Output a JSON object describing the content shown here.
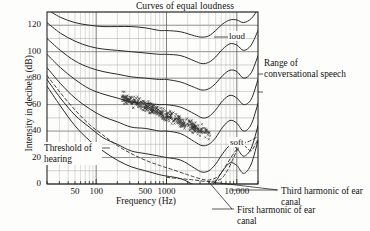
{
  "chart_data": {
    "type": "line",
    "title": "Curves of equal loudness",
    "xlabel": "Frequency (Hz)",
    "ylabel": "Intensity in decibels (dB)",
    "xscale": "log",
    "xlim": [
      20,
      20000
    ],
    "ylim": [
      0,
      130
    ],
    "grid": true,
    "legend_position": "none",
    "yticks": [
      "0",
      "20",
      "40",
      "60",
      "80",
      "100",
      "120"
    ],
    "ytick_values": [
      0,
      20,
      40,
      60,
      80,
      100,
      120
    ],
    "xticks": [
      "50",
      "100",
      "500",
      "1000",
      "10,000"
    ],
    "xtick_values": [
      50,
      100,
      500,
      1000,
      10000
    ],
    "annotations": [
      {
        "name": "loud",
        "text": "loud",
        "x": 6000,
        "y": 105
      },
      {
        "name": "soft",
        "text": "soft",
        "x": 6000,
        "y": 31
      },
      {
        "name": "threshold-of-hearing",
        "text": "Threshold of hearing",
        "x": 40,
        "y": 20
      },
      {
        "name": "range-of-conversational-speech",
        "text": "Range of conversational speech"
      },
      {
        "name": "third-harmonic-of-ear-canal",
        "text": "Third harmonic of ear canal"
      },
      {
        "name": "first-harmonic-of-ear-canal",
        "text": "First harmonic of ear canal"
      }
    ],
    "series": [
      {
        "name": "equal-loudness-120-phon",
        "style": "solid",
        "points": [
          [
            20,
            132
          ],
          [
            31,
            126
          ],
          [
            50,
            122
          ],
          [
            80,
            120
          ],
          [
            125,
            119
          ],
          [
            200,
            119
          ],
          [
            315,
            119
          ],
          [
            500,
            118
          ],
          [
            800,
            116
          ],
          [
            1000,
            116
          ],
          [
            1600,
            115
          ],
          [
            2500,
            112
          ],
          [
            3200,
            111
          ],
          [
            4000,
            112
          ],
          [
            5000,
            116
          ],
          [
            6300,
            121
          ],
          [
            8000,
            124
          ],
          [
            10000,
            124
          ],
          [
            12500,
            122
          ],
          [
            16000,
            125
          ],
          [
            20000,
            132
          ]
        ]
      },
      {
        "name": "equal-loudness-100-phon",
        "style": "solid",
        "points": [
          [
            20,
            122
          ],
          [
            31,
            114
          ],
          [
            50,
            108
          ],
          [
            80,
            104
          ],
          [
            125,
            102
          ],
          [
            200,
            101
          ],
          [
            315,
            100
          ],
          [
            500,
            99
          ],
          [
            800,
            98
          ],
          [
            1000,
            98
          ],
          [
            1600,
            97
          ],
          [
            2500,
            93
          ],
          [
            3200,
            91
          ],
          [
            4000,
            92
          ],
          [
            5000,
            96
          ],
          [
            6300,
            102
          ],
          [
            8000,
            106
          ],
          [
            10000,
            105
          ],
          [
            12500,
            101
          ],
          [
            16000,
            105
          ],
          [
            20000,
            116
          ]
        ]
      },
      {
        "name": "equal-loudness-80-phon",
        "style": "solid",
        "points": [
          [
            20,
            110
          ],
          [
            31,
            101
          ],
          [
            50,
            93
          ],
          [
            80,
            88
          ],
          [
            125,
            85
          ],
          [
            200,
            83
          ],
          [
            315,
            81
          ],
          [
            500,
            80
          ],
          [
            800,
            79
          ],
          [
            1000,
            79
          ],
          [
            1600,
            77
          ],
          [
            2500,
            73
          ],
          [
            3200,
            71
          ],
          [
            4000,
            72
          ],
          [
            5000,
            76
          ],
          [
            6300,
            82
          ],
          [
            8000,
            86
          ],
          [
            10000,
            85
          ],
          [
            12500,
            80
          ],
          [
            16000,
            84
          ],
          [
            20000,
            97
          ]
        ]
      },
      {
        "name": "equal-loudness-60-phon",
        "style": "solid",
        "points": [
          [
            20,
            98
          ],
          [
            31,
            88
          ],
          [
            50,
            79
          ],
          [
            80,
            72
          ],
          [
            125,
            68
          ],
          [
            200,
            65
          ],
          [
            315,
            62
          ],
          [
            500,
            61
          ],
          [
            800,
            60
          ],
          [
            1000,
            60
          ],
          [
            1600,
            58
          ],
          [
            2500,
            53
          ],
          [
            3200,
            50
          ],
          [
            4000,
            51
          ],
          [
            5000,
            56
          ],
          [
            6300,
            63
          ],
          [
            8000,
            67
          ],
          [
            10000,
            65
          ],
          [
            12500,
            60
          ],
          [
            16000,
            64
          ],
          [
            20000,
            79
          ]
        ]
      },
      {
        "name": "equal-loudness-40-phon",
        "style": "solid",
        "points": [
          [
            20,
            88
          ],
          [
            31,
            76
          ],
          [
            50,
            65
          ],
          [
            80,
            57
          ],
          [
            125,
            51
          ],
          [
            200,
            47
          ],
          [
            315,
            43
          ],
          [
            500,
            42
          ],
          [
            800,
            40
          ],
          [
            1000,
            40
          ],
          [
            1600,
            38
          ],
          [
            2500,
            32
          ],
          [
            3200,
            29
          ],
          [
            4000,
            30
          ],
          [
            5000,
            35
          ],
          [
            6300,
            43
          ],
          [
            8000,
            48
          ],
          [
            10000,
            46
          ],
          [
            12500,
            40
          ],
          [
            16000,
            45
          ],
          [
            20000,
            61
          ]
        ]
      },
      {
        "name": "equal-loudness-20-phon",
        "style": "solid",
        "points": [
          [
            20,
            79
          ],
          [
            31,
            65
          ],
          [
            50,
            52
          ],
          [
            80,
            43
          ],
          [
            125,
            35
          ],
          [
            200,
            30
          ],
          [
            315,
            25
          ],
          [
            500,
            23
          ],
          [
            800,
            21
          ],
          [
            1000,
            20
          ],
          [
            1600,
            18
          ],
          [
            2500,
            12
          ],
          [
            3200,
            9
          ],
          [
            4000,
            10
          ],
          [
            5000,
            15
          ],
          [
            6300,
            23
          ],
          [
            8000,
            29
          ],
          [
            10000,
            27
          ],
          [
            12500,
            21
          ],
          [
            16000,
            27
          ],
          [
            20000,
            44
          ]
        ]
      },
      {
        "name": "threshold-of-hearing-curve",
        "style": "solid",
        "points": [
          [
            20,
            74
          ],
          [
            31,
            59
          ],
          [
            50,
            44
          ],
          [
            80,
            33
          ],
          [
            125,
            25
          ],
          [
            200,
            18
          ],
          [
            315,
            13
          ],
          [
            500,
            10
          ],
          [
            800,
            7
          ],
          [
            1000,
            6
          ],
          [
            1600,
            4
          ],
          [
            2500,
            -1
          ],
          [
            3200,
            -4
          ],
          [
            4000,
            -3
          ],
          [
            5000,
            2
          ],
          [
            6300,
            10
          ],
          [
            8000,
            16
          ],
          [
            10000,
            14
          ],
          [
            12500,
            8
          ],
          [
            16000,
            15
          ],
          [
            20000,
            33
          ]
        ]
      },
      {
        "name": "first-harmonic-of-ear-canal",
        "style": "dashed",
        "points": [
          [
            20,
            82
          ],
          [
            31,
            69
          ],
          [
            50,
            56
          ],
          [
            80,
            45
          ],
          [
            125,
            37
          ],
          [
            200,
            29
          ],
          [
            315,
            23
          ],
          [
            500,
            18
          ],
          [
            800,
            14
          ],
          [
            1200,
            11
          ],
          [
            2000,
            7
          ],
          [
            3000,
            4
          ],
          [
            4000,
            3
          ],
          [
            5500,
            6
          ],
          [
            7000,
            14
          ],
          [
            9000,
            23
          ],
          [
            11000,
            29
          ],
          [
            13000,
            31
          ],
          [
            16000,
            33
          ],
          [
            20000,
            36
          ]
        ]
      },
      {
        "name": "third-harmonic-of-ear-canal",
        "style": "dashed",
        "points": [
          [
            1000,
            5
          ],
          [
            1600,
            4
          ],
          [
            2500,
            3
          ],
          [
            3500,
            2
          ],
          [
            4500,
            2
          ],
          [
            6000,
            4
          ],
          [
            7500,
            11
          ],
          [
            9000,
            20
          ],
          [
            10500,
            27
          ],
          [
            12000,
            30
          ],
          [
            14000,
            27
          ],
          [
            16000,
            25
          ],
          [
            18000,
            29
          ],
          [
            20000,
            34
          ]
        ]
      }
    ],
    "scatter": {
      "name": "conversational-speech-cloud",
      "marker": "x",
      "n_points": 420,
      "x_range": [
        230,
        4200
      ],
      "y_range": [
        38,
        66
      ],
      "note": "dense cloud of small x markers trending downward from ~64 dB at 250 Hz to ~42 dB at 4000 Hz"
    }
  }
}
